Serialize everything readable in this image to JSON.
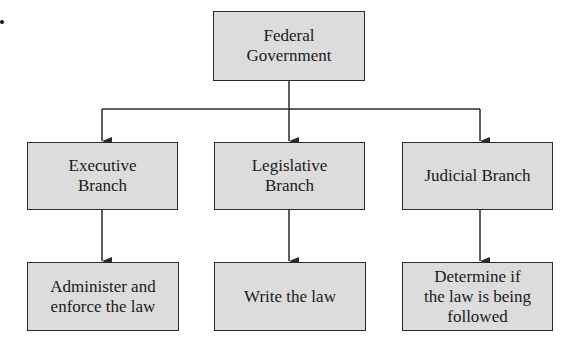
{
  "diagram": {
    "type": "org-chart",
    "root": {
      "label": "Federal\nGovernment"
    },
    "branches": [
      {
        "label": "Executive\nBranch",
        "function": "Administer and\nenforce the law"
      },
      {
        "label": "Legislative\nBranch",
        "function": "Write the law"
      },
      {
        "label": "Judicial Branch",
        "function": "Determine if\nthe law is being\nfollowed"
      }
    ],
    "colors": {
      "box_fill": "#dcdcdc",
      "border": "#2a2a2a",
      "line": "#2a2a2a"
    }
  }
}
